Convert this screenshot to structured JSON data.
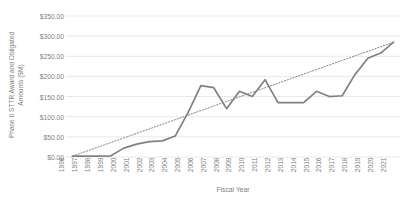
{
  "chart_data": {
    "type": "line",
    "title": "",
    "xlabel": "Fiscal Year",
    "ylabel": "Phase II STTR Award and Obligated Amounts ($M)",
    "ylabel_line1": "Phase II STTR Award and Obligated",
    "ylabel_line2": "Amounts ($M)",
    "categories": [
      "1996",
      "1997",
      "1998",
      "1999",
      "2000",
      "2001",
      "2002",
      "2003",
      "2004",
      "2005",
      "2006",
      "2007",
      "2008",
      "2009",
      "2010",
      "2011",
      "2012",
      "2013",
      "2014",
      "2015",
      "2016",
      "2017",
      "2018",
      "2019",
      "2020",
      "2021"
    ],
    "values": [
      2,
      2,
      2,
      3,
      22,
      32,
      38,
      40,
      52,
      110,
      177,
      172,
      120,
      163,
      150,
      192,
      135,
      135,
      135,
      163,
      150,
      152,
      205,
      245,
      258,
      285
    ],
    "series": [
      {
        "name": "Phase II STTR Award and Obligated Amounts",
        "values": [
          2,
          2,
          2,
          3,
          22,
          32,
          38,
          40,
          52,
          110,
          177,
          172,
          120,
          163,
          150,
          192,
          135,
          135,
          135,
          163,
          150,
          152,
          205,
          245,
          258,
          285
        ]
      }
    ],
    "trendline": {
      "type": "linear",
      "style": "dotted",
      "start_value": 2,
      "end_value": 285
    },
    "yticks": [
      "$0.00",
      "$50.00",
      "$100.00",
      "$150.00",
      "$200.00",
      "$250.00",
      "$300.00",
      "$350.00"
    ],
    "ytick_values": [
      0,
      50,
      100,
      150,
      200,
      250,
      300,
      350
    ],
    "ylim": [
      0,
      350
    ],
    "xlim": [
      "1996",
      "2021"
    ],
    "grid": "horizontal",
    "legend": "none",
    "colors": {
      "series_line": "#808080",
      "trendline": "#808080",
      "gridline": "#e8e8e8",
      "text": "#7f7f7f",
      "background": "#ffffff"
    }
  }
}
